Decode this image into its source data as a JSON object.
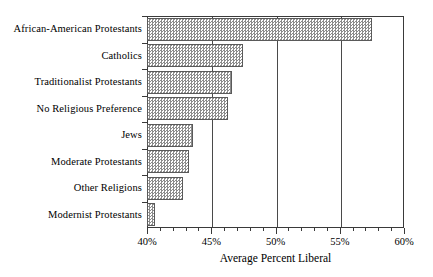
{
  "chart_data": {
    "type": "bar",
    "orientation": "horizontal",
    "title": "",
    "xlabel": "Average Percent Liberal",
    "ylabel": "",
    "xlim": [
      40,
      60
    ],
    "xticks": [
      40,
      45,
      50,
      55,
      60
    ],
    "xtick_labels": [
      "40%",
      "45%",
      "50%",
      "55%",
      "60%"
    ],
    "xtick_minor_step": 1,
    "grid": "vertical-major",
    "legend": "none",
    "bar_fill": "#8c8c8c",
    "bar_pattern": "checkerboard-hatch",
    "bar_edge_color": "#5a5a5a",
    "axis_color": "#3a3a3a",
    "categories": [
      "African-American Protestants",
      "Catholics",
      "Traditionalist Protestants",
      "No Religious Preference",
      "Jews",
      "Moderate Protestants",
      "Other Religions",
      "Modernist Protestants"
    ],
    "values": [
      57.5,
      47.5,
      46.6,
      46.3,
      43.6,
      43.3,
      42.8,
      40.6
    ],
    "value_labels": [
      "57.5%",
      "47.5%",
      "46.6%",
      "46.3%",
      "43.6%",
      "43.3%",
      "42.8%",
      "40.6%"
    ]
  }
}
